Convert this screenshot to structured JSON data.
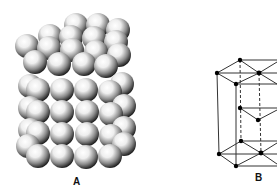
{
  "figure": {
    "panels": [
      {
        "id": "A",
        "label": "A",
        "description": "Space-filling model of hexagonal close-packed spheres stacked in layers"
      },
      {
        "id": "B",
        "label": "B",
        "description": "Ball-and-stick hexagonal close-packed unit cell (lattice diagram)"
      }
    ]
  },
  "colors": {
    "background": "#ffffff",
    "sphere_highlight": "#ffffff",
    "sphere_shadow": "#1a1a1a",
    "line": "#333333",
    "atom": "#000000"
  },
  "lattice": {
    "top_layer": [
      [
        240,
        60
      ],
      [
        217,
        73
      ],
      [
        259,
        73
      ],
      [
        236,
        84
      ],
      [
        280,
        62
      ],
      [
        280,
        84
      ]
    ],
    "middle_layer": [
      [
        240,
        108
      ],
      [
        258,
        120
      ]
    ],
    "bottom_layer": [
      [
        241,
        141
      ],
      [
        219,
        154
      ],
      [
        261,
        153
      ],
      [
        236,
        166
      ],
      [
        280,
        141
      ],
      [
        280,
        166
      ]
    ]
  }
}
